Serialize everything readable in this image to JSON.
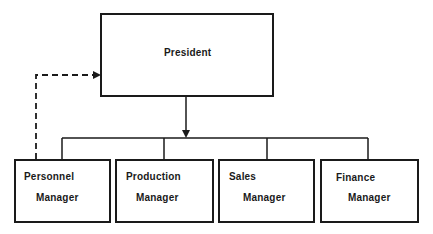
{
  "diagram": {
    "type": "org-chart",
    "top": {
      "title": "President"
    },
    "subordinates": [
      {
        "line1": "Personnel",
        "line2": "Manager"
      },
      {
        "line1": "Production",
        "line2": "Manager"
      },
      {
        "line1": "Sales",
        "line2": "Manager"
      },
      {
        "line1": "Finance",
        "line2": "Manager"
      }
    ],
    "edges": [
      {
        "from": "President",
        "to": "Managers",
        "style": "solid-arrow"
      },
      {
        "from": "Personnel Manager",
        "to": "President",
        "style": "dashed-arrow"
      }
    ],
    "colors": {
      "line": "#1a1a1a",
      "background": "#ffffff"
    }
  }
}
